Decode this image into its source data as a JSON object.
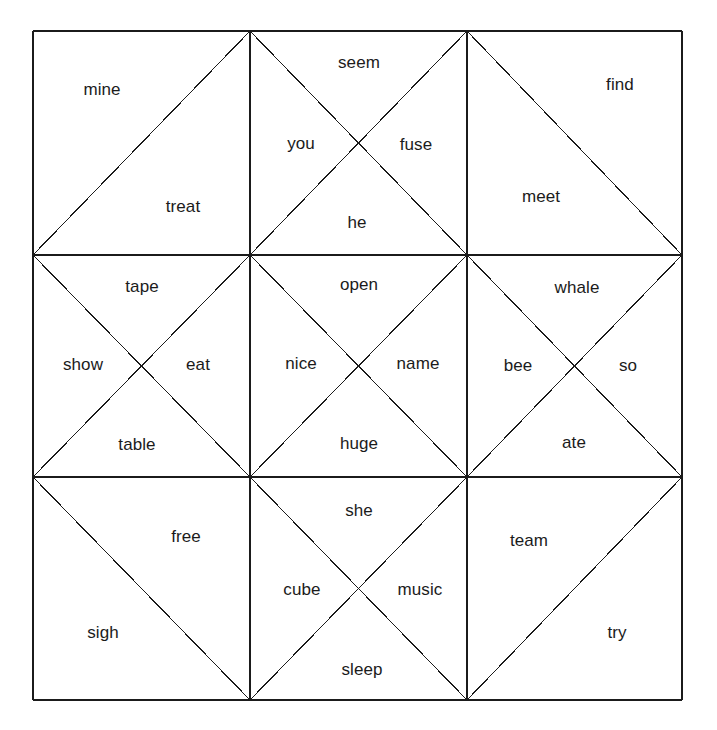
{
  "figure": {
    "kind": "word-sort-quilt-grid",
    "background_color": "#ffffff",
    "line_color": "#1b1b1b",
    "text_color": "#1b1b1b",
    "border": {
      "x": 33,
      "y": 31,
      "width": 649,
      "height": 669
    },
    "grid": {
      "columns": 3,
      "rows": 3,
      "x_lines": [
        33,
        250,
        467,
        682
      ],
      "y_lines": [
        31,
        255,
        477,
        700
      ]
    }
  },
  "cells": [
    {
      "name": "cell-top-left",
      "row": 0,
      "col": 0,
      "split": "main-diagonal",
      "words": [
        {
          "text": "mine",
          "region": "upper-left",
          "x": 102,
          "y": 89
        },
        {
          "text": "treat",
          "region": "lower-right",
          "x": 183,
          "y": 206
        }
      ]
    },
    {
      "name": "cell-top-center",
      "row": 0,
      "col": 1,
      "split": "x-both-diagonals",
      "words": [
        {
          "text": "seem",
          "region": "top",
          "x": 359,
          "y": 62
        },
        {
          "text": "you",
          "region": "left",
          "x": 301,
          "y": 143
        },
        {
          "text": "fuse",
          "region": "right",
          "x": 416,
          "y": 144
        },
        {
          "text": "he",
          "region": "bottom",
          "x": 357,
          "y": 222
        }
      ]
    },
    {
      "name": "cell-top-right",
      "row": 0,
      "col": 2,
      "split": "anti-diagonal",
      "words": [
        {
          "text": "find",
          "region": "upper-right",
          "x": 620,
          "y": 84
        },
        {
          "text": "meet",
          "region": "lower-left",
          "x": 541,
          "y": 196
        }
      ]
    },
    {
      "name": "cell-middle-left",
      "row": 1,
      "col": 0,
      "split": "x-both-diagonals",
      "words": [
        {
          "text": "tape",
          "region": "top",
          "x": 142,
          "y": 286
        },
        {
          "text": "show",
          "region": "left",
          "x": 83,
          "y": 364
        },
        {
          "text": "eat",
          "region": "right",
          "x": 198,
          "y": 364
        },
        {
          "text": "table",
          "region": "bottom",
          "x": 137,
          "y": 444
        }
      ]
    },
    {
      "name": "cell-center",
      "row": 1,
      "col": 1,
      "split": "x-both-diagonals",
      "words": [
        {
          "text": "open",
          "region": "top",
          "x": 359,
          "y": 284
        },
        {
          "text": "nice",
          "region": "left",
          "x": 301,
          "y": 363
        },
        {
          "text": "name",
          "region": "right",
          "x": 418,
          "y": 363
        },
        {
          "text": "huge",
          "region": "bottom",
          "x": 359,
          "y": 443
        }
      ]
    },
    {
      "name": "cell-middle-right",
      "row": 1,
      "col": 2,
      "split": "x-both-diagonals",
      "words": [
        {
          "text": "whale",
          "region": "top",
          "x": 577,
          "y": 287
        },
        {
          "text": "bee",
          "region": "left",
          "x": 518,
          "y": 365
        },
        {
          "text": "so",
          "region": "right",
          "x": 628,
          "y": 365
        },
        {
          "text": "ate",
          "region": "bottom",
          "x": 574,
          "y": 442
        }
      ]
    },
    {
      "name": "cell-bottom-left",
      "row": 2,
      "col": 0,
      "split": "anti-diagonal",
      "words": [
        {
          "text": "free",
          "region": "upper-right",
          "x": 186,
          "y": 536
        },
        {
          "text": "sigh",
          "region": "lower-left",
          "x": 103,
          "y": 632
        }
      ]
    },
    {
      "name": "cell-bottom-center",
      "row": 2,
      "col": 1,
      "split": "x-both-diagonals",
      "words": [
        {
          "text": "she",
          "region": "top",
          "x": 359,
          "y": 510
        },
        {
          "text": "cube",
          "region": "left",
          "x": 302,
          "y": 589
        },
        {
          "text": "music",
          "region": "right",
          "x": 420,
          "y": 589
        },
        {
          "text": "sleep",
          "region": "bottom",
          "x": 362,
          "y": 669
        }
      ]
    },
    {
      "name": "cell-bottom-right",
      "row": 2,
      "col": 2,
      "split": "main-diagonal",
      "words": [
        {
          "text": "team",
          "region": "upper-left",
          "x": 529,
          "y": 540
        },
        {
          "text": "try",
          "region": "lower-right",
          "x": 617,
          "y": 632
        }
      ]
    }
  ]
}
